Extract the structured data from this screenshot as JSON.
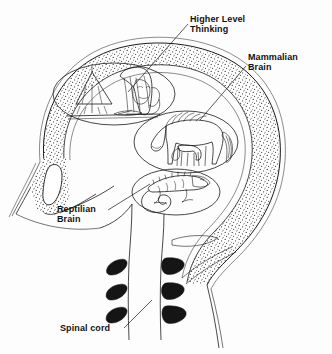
{
  "figure": {
    "type": "anatomical-line-illustration",
    "background_color": "#fdfdfd",
    "ink_color": "#1a1a1a",
    "text_color": "#111111"
  },
  "labels": {
    "higher_level_thinking": {
      "line1": "Higher Level",
      "line2": "Thinking",
      "x": 190,
      "y": 22
    },
    "mammalian_brain": {
      "line1": "Mammalian",
      "line2": "Brain",
      "x": 248,
      "y": 60
    },
    "reptilian_brain": {
      "line1": "Reptilian",
      "line2": "Brain",
      "x": 57,
      "y": 212
    },
    "spinal_cord": {
      "line1": "Spinal cord",
      "x": 60,
      "y": 331
    }
  },
  "regions": {
    "higher_level_oval": {
      "name": "girl-reading-at-desk-with-lamp",
      "cx": 114,
      "cy": 94,
      "rx": 61,
      "ry": 31
    },
    "mammalian_oval": {
      "name": "horse-with-nursing-foal",
      "cx": 186,
      "cy": 142,
      "rx": 52,
      "ry": 31
    },
    "reptilian_oval": {
      "name": "lizard-with-curled-tail",
      "cx": 176,
      "cy": 192,
      "rx": 44,
      "ry": 23
    }
  },
  "anatomy": {
    "skull": "stippled-bone-band",
    "nasal_cavity": "teardrop-void",
    "vertebrae_left_count": 3,
    "vertebrae_right_count": 3,
    "spinal_column": "brainstem-descending-to-neck"
  }
}
